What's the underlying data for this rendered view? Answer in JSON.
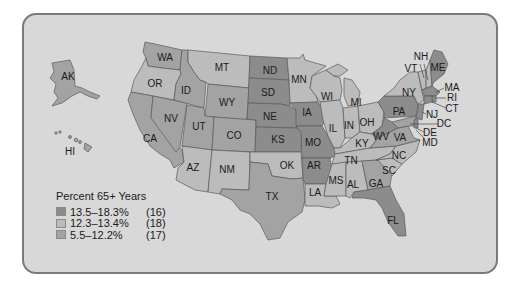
{
  "map": {
    "title": "Percent 65+ Years by State",
    "colors": {
      "background": "#d8d8d8",
      "border": "#7a7a7a",
      "high": "#8c8c8c",
      "mid": "#bcbcbc",
      "low": "#a3a3a3"
    },
    "states": [
      {
        "abbr": "AK",
        "class": "low"
      },
      {
        "abbr": "HI",
        "class": "mid"
      },
      {
        "abbr": "WA",
        "class": "low"
      },
      {
        "abbr": "OR",
        "class": "mid"
      },
      {
        "abbr": "CA",
        "class": "low"
      },
      {
        "abbr": "ID",
        "class": "low"
      },
      {
        "abbr": "NV",
        "class": "low"
      },
      {
        "abbr": "MT",
        "class": "mid"
      },
      {
        "abbr": "WY",
        "class": "low"
      },
      {
        "abbr": "UT",
        "class": "low"
      },
      {
        "abbr": "CO",
        "class": "low"
      },
      {
        "abbr": "AZ",
        "class": "mid"
      },
      {
        "abbr": "NM",
        "class": "mid"
      },
      {
        "abbr": "ND",
        "class": "high"
      },
      {
        "abbr": "SD",
        "class": "high"
      },
      {
        "abbr": "NE",
        "class": "high"
      },
      {
        "abbr": "KS",
        "class": "high"
      },
      {
        "abbr": "OK",
        "class": "mid"
      },
      {
        "abbr": "TX",
        "class": "low"
      },
      {
        "abbr": "MN",
        "class": "mid"
      },
      {
        "abbr": "IA",
        "class": "high"
      },
      {
        "abbr": "MO",
        "class": "high"
      },
      {
        "abbr": "AR",
        "class": "high"
      },
      {
        "abbr": "LA",
        "class": "mid"
      },
      {
        "abbr": "WI",
        "class": "mid"
      },
      {
        "abbr": "IL",
        "class": "mid"
      },
      {
        "abbr": "MI",
        "class": "mid"
      },
      {
        "abbr": "IN",
        "class": "mid"
      },
      {
        "abbr": "OH",
        "class": "mid"
      },
      {
        "abbr": "KY",
        "class": "mid"
      },
      {
        "abbr": "TN",
        "class": "mid"
      },
      {
        "abbr": "MS",
        "class": "mid"
      },
      {
        "abbr": "AL",
        "class": "mid"
      },
      {
        "abbr": "GA",
        "class": "low"
      },
      {
        "abbr": "FL",
        "class": "high"
      },
      {
        "abbr": "SC",
        "class": "mid"
      },
      {
        "abbr": "NC",
        "class": "mid"
      },
      {
        "abbr": "VA",
        "class": "low"
      },
      {
        "abbr": "WV",
        "class": "high"
      },
      {
        "abbr": "PA",
        "class": "high"
      },
      {
        "abbr": "NY",
        "class": "mid"
      },
      {
        "abbr": "VT",
        "class": "mid"
      },
      {
        "abbr": "NH",
        "class": "mid"
      },
      {
        "abbr": "ME",
        "class": "high"
      },
      {
        "abbr": "MA",
        "class": "high"
      },
      {
        "abbr": "RI",
        "class": "high"
      },
      {
        "abbr": "CT",
        "class": "high"
      },
      {
        "abbr": "NJ",
        "class": "high"
      },
      {
        "abbr": "DE",
        "class": "high"
      },
      {
        "abbr": "MD",
        "class": "low"
      },
      {
        "abbr": "DC",
        "class": "low"
      }
    ]
  },
  "legend": {
    "title": "Percent 65+ Years",
    "items": [
      {
        "range": "13.5–18.3%",
        "count": "(16)",
        "color": "#8c8c8c"
      },
      {
        "range": "12.3–13.4%",
        "count": "(18)",
        "color": "#bcbcbc"
      },
      {
        "range": "5.5–12.2%",
        "count": "(17)",
        "color": "#a3a3a3"
      }
    ]
  },
  "labels": {
    "AK": "AK",
    "HI": "HI",
    "WA": "WA",
    "OR": "OR",
    "CA": "CA",
    "ID": "ID",
    "NV": "NV",
    "MT": "MT",
    "WY": "WY",
    "UT": "UT",
    "CO": "CO",
    "AZ": "AZ",
    "NM": "NM",
    "ND": "ND",
    "SD": "SD",
    "NE": "NE",
    "KS": "KS",
    "OK": "OK",
    "TX": "TX",
    "MN": "MN",
    "IA": "IA",
    "MO": "MO",
    "AR": "AR",
    "LA": "LA",
    "WI": "WI",
    "IL": "IL",
    "MI": "MI",
    "IN": "IN",
    "OH": "OH",
    "KY": "KY",
    "TN": "TN",
    "MS": "MS",
    "AL": "AL",
    "GA": "GA",
    "FL": "FL",
    "SC": "SC",
    "NC": "NC",
    "VA": "VA",
    "WV": "WV",
    "PA": "PA",
    "NY": "NY",
    "VT": "VT",
    "NH": "NH",
    "ME": "ME",
    "MA": "MA",
    "RI": "RI",
    "CT": "CT",
    "NJ": "NJ",
    "DE": "DE",
    "MD": "MD",
    "DC": "DC"
  }
}
